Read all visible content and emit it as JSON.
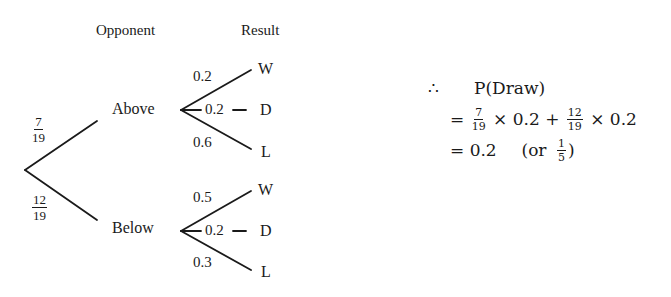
{
  "headers": {
    "opponent": "Opponent",
    "result": "Result"
  },
  "tree": {
    "first_level": [
      {
        "node": "Above",
        "prob_num": "7",
        "prob_den": "19"
      },
      {
        "node": "Below",
        "prob_num": "12",
        "prob_den": "19"
      }
    ],
    "above": {
      "win_prob": "0.2",
      "draw_prob": "0.2",
      "loss_prob": "0.6",
      "win_label": "W",
      "draw_label": "D",
      "loss_label": "L"
    },
    "below": {
      "win_prob": "0.5",
      "draw_prob": "0.2",
      "loss_prob": "0.3",
      "win_label": "W",
      "draw_label": "D",
      "loss_label": "L"
    }
  },
  "calculation": {
    "therefore_symbol": "∴",
    "line1": "P(Draw)",
    "line2": {
      "eq": "=",
      "f1_num": "7",
      "f1_den": "19",
      "times1": "× 0.2 +",
      "f2_num": "12",
      "f2_den": "19",
      "times2": "× 0.2"
    },
    "line3": {
      "eq": "= 0.2",
      "or_text": "(or",
      "f_num": "1",
      "f_den": "5",
      "close": ")"
    }
  },
  "colors": {
    "ink": "#1a1a1a",
    "background": "#ffffff"
  }
}
